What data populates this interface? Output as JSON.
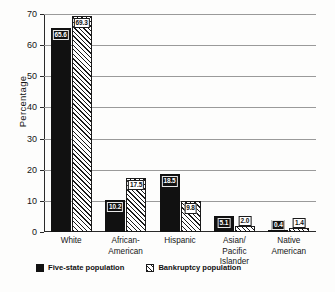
{
  "chart_data": {
    "type": "bar",
    "title": "",
    "xlabel": "",
    "ylabel": "Percentage",
    "ylim": [
      0,
      70
    ],
    "yticks": [
      0,
      10,
      20,
      30,
      40,
      50,
      60,
      70
    ],
    "grid": true,
    "legend_position": "bottom-left",
    "categories": [
      "White",
      "African-American",
      "Hispanic",
      "Asian/ Pacific Islander",
      "Native American"
    ],
    "category_lines": [
      [
        "White"
      ],
      [
        "African-",
        "American"
      ],
      [
        "Hispanic"
      ],
      [
        "Asian/",
        "Pacific Islander"
      ],
      [
        "Native American"
      ]
    ],
    "series": [
      {
        "name": "Five-state population",
        "style": "solid",
        "color": "#111111",
        "values": [
          65.6,
          10.2,
          18.5,
          5.1,
          0.4
        ],
        "labels": [
          "65.6",
          "10.2",
          "18.5",
          "5.1",
          "0.4"
        ]
      },
      {
        "name": "Bankruptcy population",
        "style": "hatched",
        "color": "#ffffff",
        "values": [
          69.3,
          17.5,
          9.8,
          2.0,
          1.4
        ],
        "labels": [
          "69.3",
          "17.5",
          "9.8",
          "2.0",
          "1.4"
        ]
      }
    ]
  }
}
